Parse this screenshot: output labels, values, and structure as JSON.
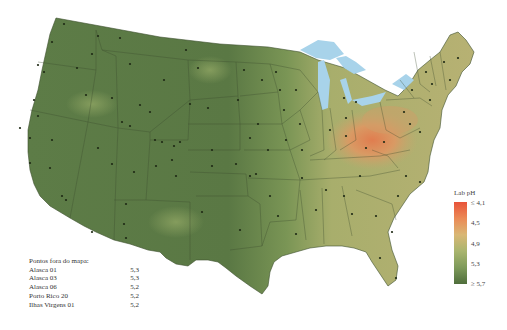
{
  "legend": {
    "title": "Lab pH",
    "ticks": [
      "≤ 4,1",
      "4,5",
      "4,9",
      "5,3",
      "≥ 5,7"
    ],
    "colors": [
      "#e8533a",
      "#eb8a56",
      "#d9b774",
      "#7e9a5a",
      "#4f6e3c"
    ]
  },
  "offmap": {
    "title": "Pontos fora do mapa:",
    "rows": [
      {
        "site": "Alasca 01",
        "value": "5,3"
      },
      {
        "site": "Alasca 03",
        "value": "5,3"
      },
      {
        "site": "Alasca 06",
        "value": "5,2"
      },
      {
        "site": "Porto Rico 20",
        "value": "5,2"
      },
      {
        "site": "Ilhas Virgens 01",
        "value": "5,2"
      }
    ]
  },
  "map": {
    "region": "Contiguous United States",
    "variable": "Lab pH",
    "colors": {
      "west_green": "#5a7a45",
      "plains_green": "#6f8c52",
      "southeast_tan": "#b6b677",
      "northeast_tan": "#b9ad6e",
      "ohio_orange": "#d99563",
      "lakes_blue": "#a8d3ea",
      "station_dot": "#1e2a14"
    }
  }
}
